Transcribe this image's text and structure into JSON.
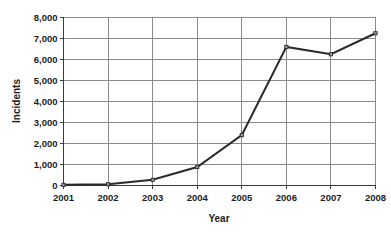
{
  "chart_data": {
    "type": "line",
    "title": "",
    "xlabel": "Year",
    "ylabel": "Incidents",
    "categories": [
      "2001",
      "2002",
      "2003",
      "2004",
      "2005",
      "2006",
      "2007",
      "2008"
    ],
    "x": [
      2001,
      2002,
      2003,
      2004,
      2005,
      2006,
      2007,
      2008
    ],
    "values": [
      30,
      60,
      270,
      880,
      2400,
      6600,
      6250,
      7250
    ],
    "series": [
      {
        "name": "Incidents",
        "values": [
          30,
          60,
          270,
          880,
          2400,
          6600,
          6250,
          7250
        ]
      }
    ],
    "xlim": [
      2001,
      2008
    ],
    "ylim": [
      0,
      8000
    ],
    "ytick_labels": [
      "0",
      "1,000",
      "2,000",
      "3,000",
      "4,000",
      "5,000",
      "6,000",
      "7,000",
      "8,000"
    ],
    "ytick_values": [
      0,
      1000,
      2000,
      3000,
      4000,
      5000,
      6000,
      7000,
      8000
    ],
    "xtick_labels": [
      "2001",
      "2002",
      "2003",
      "2004",
      "2005",
      "2006",
      "2007",
      "2008"
    ],
    "grid": true,
    "grid_axes": "both",
    "legend": false,
    "legend_position": "none",
    "marker": "square",
    "line_color": "#2b2b2b",
    "grid_color": "#8a8a8a",
    "axis_color": "#3a3a3a",
    "background_color": "#ffffff"
  }
}
